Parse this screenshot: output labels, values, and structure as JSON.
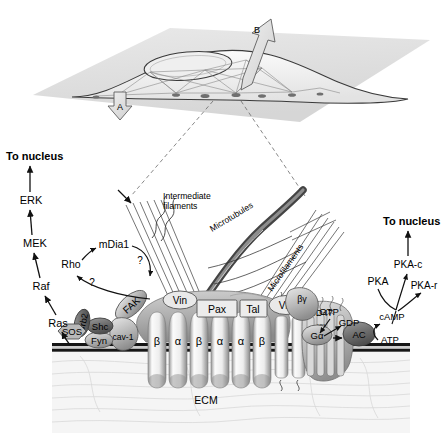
{
  "figure": {
    "type": "biological-schematic"
  },
  "cell_overview": {
    "arrow_a_label": "A",
    "arrow_b_label": "B"
  },
  "cytoskeleton_labels": {
    "intermediate_filaments_line1": "Intermediate",
    "intermediate_filaments_line2": "filaments",
    "microtubules": "Microtubules",
    "microfilaments": "Microfilaments"
  },
  "left_cascade": {
    "to_nucleus": "To nucleus",
    "erk": "ERK",
    "mek": "MEK",
    "raf": "Raf",
    "ras": "Ras",
    "rho": "Rho",
    "mdia1": "mDia1",
    "question_1": "?",
    "question_2": "?"
  },
  "adaptors": {
    "sos": "SOS",
    "grb2": "Grb2",
    "shc": "Shc",
    "fyn": "Fyn",
    "fak": "FAK",
    "cav1": "cav-1"
  },
  "adhesion_plaque": {
    "vinculin_left": "Vin",
    "paxillin": "Pax",
    "talin": "Tal",
    "vinculin_right": "Vin"
  },
  "integrins": {
    "subunits": [
      "β",
      "α",
      "β",
      "α",
      "α",
      "β"
    ],
    "pair_alpha": "α",
    "pair_beta": "β"
  },
  "receptors": {
    "cd47": "CD47",
    "cd47_question": "(?)"
  },
  "g_protein": {
    "g_beta_gamma": "βγ",
    "g_alpha": "Gα",
    "gtp": "GTP",
    "gdp": "GDP",
    "ac": "AC",
    "atp": "ATP",
    "camp": "cAMP"
  },
  "right_cascade": {
    "to_nucleus": "To nucleus",
    "pka": "PKA",
    "pka_c": "PKA-c",
    "pka_r": "PKA-r"
  },
  "matrix": {
    "ecm": "ECM"
  },
  "colors": {
    "background": "#ffffff",
    "text": "#000000",
    "membrane": "#1a1a1a",
    "protein_fill": "#b4b4b4",
    "protein_dark": "#6e6e6e",
    "integrin_light": "#f2f2f2",
    "ecm_fill": "#f4f4f4",
    "substrate": "#d8d8d8",
    "microtubule": "#4a4a4a"
  }
}
